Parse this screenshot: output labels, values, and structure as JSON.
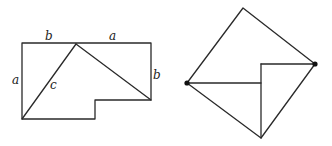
{
  "figure": {
    "left": {
      "labels": {
        "top_left_segment": "b",
        "top_right_segment": "a",
        "left_side": "a",
        "right_side": "b",
        "hypotenuse": "c"
      }
    },
    "right": {
      "labels": {}
    }
  },
  "colors": {
    "stroke": "#2a2a2a",
    "background": "#ffffff"
  }
}
